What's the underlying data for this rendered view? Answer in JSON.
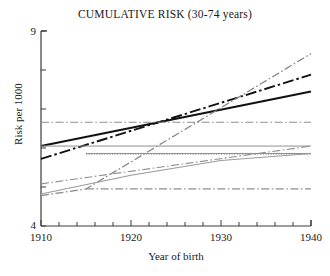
{
  "chart_data": {
    "type": "line",
    "title": "CUMULATIVE RISK (30-74 years)",
    "xlabel": "Year of birth",
    "ylabel": "Risk per 1000",
    "xlim": [
      1910,
      1940
    ],
    "ylim": [
      4,
      9
    ],
    "grid": false,
    "legend": "none",
    "x_tick_labels": [
      "1910",
      "1920",
      "1930",
      "1940"
    ],
    "x_tick_values": [
      1910,
      1920,
      1930,
      1940
    ],
    "x_minor_tick_step": 2,
    "y_tick_labels": [
      "4",
      "9"
    ],
    "y_tick_values": [
      4,
      9
    ],
    "y_minor_tick_values": [
      5,
      6,
      7,
      8
    ],
    "series": [
      {
        "name": "black-solid-steep",
        "style": "solid",
        "color": "#111111",
        "width": 1.9,
        "x": [
          1910,
          1940
        ],
        "values": [
          6.05,
          7.45
        ]
      },
      {
        "name": "black-dashdot-steep",
        "style": "dashdot",
        "color": "#111111",
        "width": 1.9,
        "x": [
          1910,
          1940
        ],
        "values": [
          5.72,
          7.88
        ]
      },
      {
        "name": "gray-dashdot-steepest",
        "style": "dashdot",
        "color": "#8a8a8a",
        "width": 1.3,
        "x": [
          1910,
          1915,
          1940
        ],
        "values": [
          4.78,
          4.95,
          8.42
        ]
      },
      {
        "name": "gray-dashdot-flat-upper",
        "style": "dashdot",
        "color": "#8e8e8e",
        "width": 1.0,
        "x": [
          1910,
          1940
        ],
        "values": [
          6.66,
          6.66
        ]
      },
      {
        "name": "gray-solid-flat-mid",
        "style": "solid",
        "color": "#8e8e8e",
        "width": 1.0,
        "x": [
          1910,
          1940
        ],
        "values": [
          6.05,
          6.05
        ]
      },
      {
        "name": "gray-dotted-flat",
        "style": "dotted",
        "color": "#8e8e8e",
        "width": 1.0,
        "x": [
          1915,
          1940
        ],
        "values": [
          5.84,
          5.84
        ]
      },
      {
        "name": "gray-solid-flat-lower",
        "style": "solid",
        "color": "#8e8e8e",
        "width": 1.0,
        "x": [
          1915,
          1940
        ],
        "values": [
          5.86,
          5.86
        ]
      },
      {
        "name": "gray-dashdot-rising-shallow",
        "style": "dashdot",
        "color": "#8e8e8e",
        "width": 1.1,
        "x": [
          1910,
          1940
        ],
        "values": [
          5.08,
          6.05
        ]
      },
      {
        "name": "gray-solid-rising-plateau",
        "style": "solid",
        "color": "#9a9a9a",
        "width": 1.1,
        "x": [
          1910,
          1920,
          1930,
          1940
        ],
        "values": [
          4.82,
          5.3,
          5.68,
          5.86
        ]
      },
      {
        "name": "gray-dashdot-flat-lowest",
        "style": "dashdot",
        "color": "#8e8e8e",
        "width": 1.3,
        "x": [
          1915,
          1940
        ],
        "values": [
          4.95,
          4.95
        ]
      }
    ]
  },
  "axes": {
    "y_label_top": "9",
    "y_label_bottom": "4",
    "x_label_1": "1910",
    "x_label_2": "1920",
    "x_label_3": "1930",
    "x_label_4": "1940"
  }
}
